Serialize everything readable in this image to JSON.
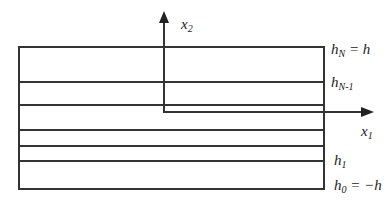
{
  "diagram": {
    "colors": {
      "line": "#333333",
      "background": "#ffffff"
    },
    "axes": {
      "x1": {
        "base": "x",
        "sub": "1"
      },
      "x2": {
        "base": "x",
        "sub": "2"
      }
    },
    "interfaces": [
      {
        "id": "hN",
        "base": "h",
        "sub": "N",
        "rest": " = h"
      },
      {
        "id": "hN-1",
        "base": "h",
        "sub": "N-1",
        "rest": ""
      },
      {
        "id": "h1",
        "base": "h",
        "sub": "1",
        "rest": ""
      },
      {
        "id": "h0",
        "base": "h",
        "sub": "0",
        "rest": " = −h"
      }
    ],
    "layer_count_visible": 6
  }
}
